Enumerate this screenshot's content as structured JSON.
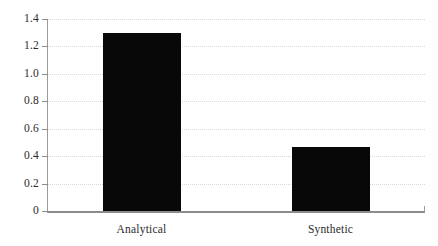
{
  "chart_data": {
    "type": "bar",
    "title": "",
    "subtitle": "",
    "xlabel": "",
    "ylabel": "",
    "categories": [
      "Analytical",
      "Synthetic"
    ],
    "values": [
      1.3,
      0.47
    ],
    "series": [
      {
        "name": "",
        "values": [
          1.3,
          0.47
        ]
      }
    ],
    "ylim": [
      0,
      1.4
    ],
    "yticks": [
      0,
      0.2,
      0.4,
      0.6,
      0.8,
      1.0,
      1.2,
      1.4
    ],
    "ytick_labels": [
      "0",
      "0.2",
      "0.4",
      "0.6",
      "0.8",
      "1.0",
      "1.2",
      "1.4"
    ],
    "grid": true,
    "grid_axis": "y",
    "grid_style": "dotted",
    "legend": false,
    "legend_position": "none",
    "bar_color": "#080808",
    "grid_color": "#d9d9d9",
    "axis_color": "#8c8c8c",
    "text_color": "#2b2b2b",
    "background_color": "#ffffff"
  }
}
